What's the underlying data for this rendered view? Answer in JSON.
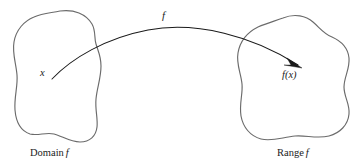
{
  "diagram": {
    "type": "function-mapping-diagram",
    "background_color": "#ffffff",
    "outline_color": "#6b6b6b",
    "arrow_color": "#1a1a1a",
    "text_color": "#1c1c1c",
    "labels": {
      "mapping_label": "f",
      "domain_element": "x",
      "range_element": "f(x)",
      "domain_caption_word": "Domain",
      "domain_caption_symbol": "f",
      "range_caption_word": "Range",
      "range_caption_symbol": "f"
    },
    "shapes": {
      "domain_blob_name": "Domain f",
      "range_blob_name": "Range f"
    },
    "arrow": {
      "from": "x",
      "to": "f(x)",
      "style": "curved-arc-with-filled-arrowhead",
      "direction": "left-to-right"
    }
  }
}
